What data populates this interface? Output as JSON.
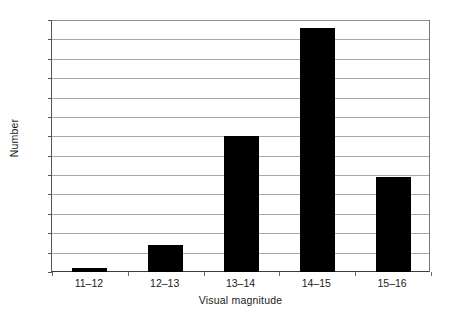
{
  "chart_data": {
    "type": "bar",
    "title": "",
    "xlabel": "Visual magnitude",
    "ylabel": "Number",
    "categories": [
      "11–12",
      "12–13",
      "13–14",
      "14–15",
      "15–16"
    ],
    "values": [
      2,
      14,
      70,
      126,
      49
    ],
    "series": [
      {
        "name": "Number",
        "values": [
          2,
          14,
          70,
          126,
          49
        ]
      }
    ],
    "ylim": [
      0,
      130
    ],
    "ytick_step": 10,
    "yticks": [
      0,
      10,
      20,
      30,
      40,
      50,
      60,
      70,
      80,
      90,
      100,
      110,
      120,
      130
    ],
    "ytick_labels": [
      "0",
      "10",
      "20",
      "30",
      "40",
      "50",
      "60",
      "70",
      "80",
      "90",
      "100",
      "110",
      "120",
      "130"
    ],
    "xlim": [
      0,
      5
    ],
    "grid": "horizontal",
    "legend": "none",
    "bar_color": "#000000",
    "gridline_color": "#a8a8a8",
    "axis_color": "#3b3b3b",
    "background_color": "#ffffff"
  }
}
